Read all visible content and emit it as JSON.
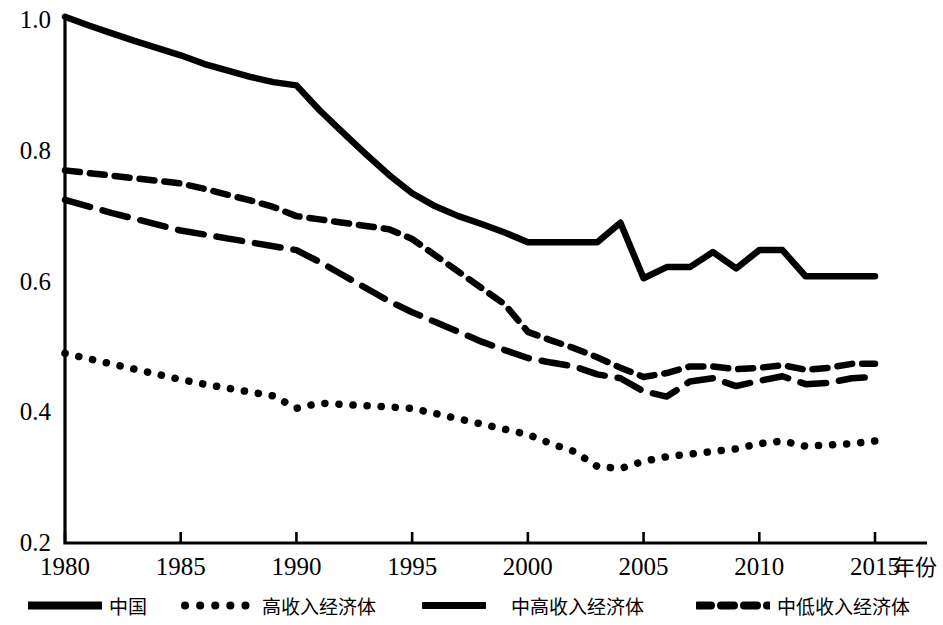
{
  "chart_data": {
    "type": "line",
    "title": "",
    "xlabel": "年份",
    "ylabel": "",
    "xlim": [
      1980,
      2015
    ],
    "ylim": [
      0.2,
      1.0
    ],
    "grid": false,
    "legend_position": "bottom",
    "x_ticks": [
      "1980",
      "1985",
      "1990",
      "1995",
      "2000",
      "2005",
      "2010",
      "2015"
    ],
    "y_ticks": [
      "0.2",
      "0.4",
      "0.6",
      "0.8",
      "1.0"
    ],
    "x": [
      1980,
      1981,
      1982,
      1983,
      1984,
      1985,
      1986,
      1987,
      1988,
      1989,
      1990,
      1991,
      1992,
      1993,
      1994,
      1995,
      1996,
      1997,
      1998,
      1999,
      2000,
      2001,
      2002,
      2003,
      2004,
      2005,
      2006,
      2007,
      2008,
      2009,
      2010,
      2011,
      2012,
      2013,
      2014,
      2015
    ],
    "series": [
      {
        "name": "中国",
        "style": "solid",
        "values": [
          1.005,
          0.992,
          0.98,
          0.968,
          0.957,
          0.946,
          0.933,
          0.923,
          0.913,
          0.905,
          0.9,
          0.862,
          0.828,
          0.795,
          0.763,
          0.735,
          0.715,
          0.7,
          0.688,
          0.675,
          0.66,
          0.66,
          0.66,
          0.66,
          0.69,
          0.605,
          0.622,
          0.622,
          0.645,
          0.62,
          0.648,
          0.648,
          0.608,
          0.608,
          0.608,
          0.608
        ]
      },
      {
        "name": "高收入经济体",
        "style": "dotted",
        "values": [
          0.49,
          0.482,
          0.474,
          0.466,
          0.458,
          0.45,
          0.443,
          0.437,
          0.431,
          0.425,
          0.406,
          0.414,
          0.412,
          0.41,
          0.408,
          0.406,
          0.398,
          0.39,
          0.382,
          0.374,
          0.366,
          0.352,
          0.34,
          0.317,
          0.314,
          0.325,
          0.332,
          0.336,
          0.34,
          0.344,
          0.352,
          0.356,
          0.348,
          0.35,
          0.352,
          0.356
        ]
      },
      {
        "name": "中高收入经济体",
        "style": "long-dash",
        "values": [
          0.725,
          0.715,
          0.705,
          0.696,
          0.687,
          0.678,
          0.672,
          0.666,
          0.66,
          0.654,
          0.648,
          0.63,
          0.61,
          0.59,
          0.57,
          0.553,
          0.538,
          0.523,
          0.508,
          0.495,
          0.483,
          0.476,
          0.47,
          0.458,
          0.452,
          0.432,
          0.424,
          0.447,
          0.452,
          0.44,
          0.448,
          0.455,
          0.443,
          0.445,
          0.452,
          0.454
        ]
      },
      {
        "name": "中低收入经济体",
        "style": "short-dash",
        "values": [
          0.77,
          0.766,
          0.762,
          0.758,
          0.754,
          0.75,
          0.742,
          0.733,
          0.724,
          0.714,
          0.7,
          0.695,
          0.69,
          0.685,
          0.68,
          0.665,
          0.64,
          0.615,
          0.59,
          0.565,
          0.523,
          0.51,
          0.498,
          0.484,
          0.468,
          0.454,
          0.46,
          0.47,
          0.47,
          0.466,
          0.468,
          0.472,
          0.465,
          0.468,
          0.474,
          0.474
        ]
      }
    ]
  },
  "axes": {
    "x_axis_label": "年份",
    "y_tick_labels": [
      "1.0",
      "0.8",
      "0.6",
      "0.4",
      "0.2"
    ],
    "x_tick_labels": [
      "1980",
      "1985",
      "1990",
      "1995",
      "2000",
      "2005",
      "2010",
      "2015"
    ]
  },
  "legend": {
    "items": [
      {
        "label": "中国",
        "style": "solid"
      },
      {
        "label": "高收入经济体",
        "style": "dotted"
      },
      {
        "label": "中高收入经济体",
        "style": "solid-thick"
      },
      {
        "label": "中低收入经济体",
        "style": "short-dash"
      }
    ]
  },
  "colors": {
    "line": "#000000",
    "axis": "#000000",
    "background": "#ffffff"
  }
}
